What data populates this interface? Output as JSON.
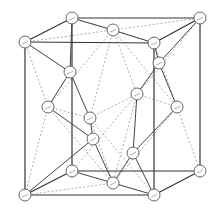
{
  "diagram": {
    "atom_radius": 6,
    "atoms": {
      "A": [
        72,
        18
      ],
      "B": [
        200,
        18
      ],
      "C": [
        25,
        42
      ],
      "D": [
        154,
        43
      ],
      "E": [
        72,
        171
      ],
      "F": [
        200,
        171
      ],
      "G": [
        25,
        195
      ],
      "H": [
        154,
        195
      ],
      "FT": [
        113,
        30
      ],
      "FB": [
        113,
        183
      ],
      "FL": [
        48,
        107
      ],
      "FR": [
        177,
        107
      ],
      "FF": [
        90,
        118
      ],
      "FK": [
        137,
        94
      ],
      "T1": [
        70,
        72
      ],
      "T2": [
        159,
        63
      ],
      "T3": [
        93,
        139
      ],
      "T4": [
        133,
        153
      ]
    },
    "cube_edges": [
      [
        "A",
        "B"
      ],
      [
        "C",
        "D"
      ],
      [
        "A",
        "C"
      ],
      [
        "B",
        "D"
      ],
      [
        "A",
        "E"
      ],
      [
        "C",
        "G"
      ],
      [
        "D",
        "H"
      ],
      [
        "B",
        "F"
      ],
      [
        "E",
        "F"
      ],
      [
        "G",
        "H"
      ],
      [
        "E",
        "G"
      ],
      [
        "F",
        "H"
      ]
    ],
    "bonds": [
      [
        "T1",
        "C"
      ],
      [
        "T1",
        "A"
      ],
      [
        "T1",
        "FF"
      ],
      [
        "T1",
        "FL"
      ],
      [
        "T2",
        "B"
      ],
      [
        "T2",
        "D"
      ],
      [
        "T2",
        "FK"
      ],
      [
        "T2",
        "FR"
      ],
      [
        "T3",
        "G"
      ],
      [
        "T3",
        "FF"
      ],
      [
        "T3",
        "FB"
      ],
      [
        "T3",
        "FL"
      ],
      [
        "T4",
        "H"
      ],
      [
        "T4",
        "FK"
      ],
      [
        "T4",
        "FB"
      ],
      [
        "T4",
        "FR"
      ],
      [
        "FT",
        "A"
      ],
      [
        "FT",
        "D"
      ],
      [
        "FB",
        "E"
      ],
      [
        "FB",
        "H"
      ]
    ],
    "dashed": [
      [
        "A",
        "D"
      ],
      [
        "C",
        "FT"
      ],
      [
        "FT",
        "B"
      ],
      [
        "FT",
        "FF"
      ],
      [
        "FT",
        "FK"
      ],
      [
        "FT",
        "FL"
      ],
      [
        "FT",
        "FR"
      ],
      [
        "FL",
        "FF"
      ],
      [
        "FL",
        "C"
      ],
      [
        "FL",
        "G"
      ],
      [
        "FL",
        "FB"
      ],
      [
        "FR",
        "FB"
      ],
      [
        "FR",
        "F"
      ],
      [
        "FR",
        "FK"
      ],
      [
        "FR",
        "D"
      ],
      [
        "FF",
        "FK"
      ],
      [
        "FF",
        "FB"
      ],
      [
        "FK",
        "FB"
      ],
      [
        "FB",
        "G"
      ],
      [
        "FF",
        "H"
      ],
      [
        "FK",
        "E"
      ],
      [
        "FK",
        "B"
      ]
    ]
  }
}
